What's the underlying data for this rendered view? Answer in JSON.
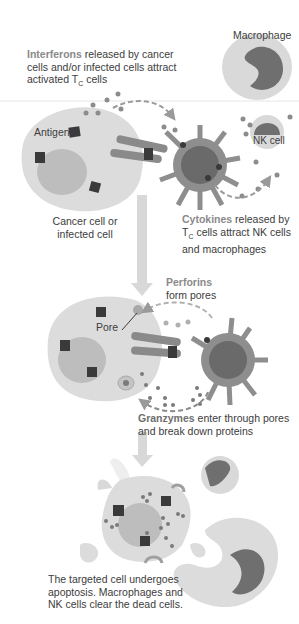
{
  "diagram": {
    "colors": {
      "cell_fill": "#dcdcdc",
      "nucleus_fill": "#bdbdbd",
      "antigen": "#3a3a3a",
      "tcell_body": "#8e8e8e",
      "tcell_core": "#6a6a6a",
      "receptor": "#8a8a8a",
      "dots": "#8c8c8c",
      "arrow": "#c8c8c8",
      "macrophage_outer": "#d8d8d8",
      "macrophage_nucleus": "#6f6f6f"
    },
    "stage1": {
      "interferons_keyword": "Interferons",
      "interferons_rest": " released by cancer cells and/or infected cells attract activated T",
      "interferons_sub": "C",
      "interferons_tail": " cells",
      "macrophage_label": "Macrophage",
      "antigen_label": "Antigen",
      "nk_label": "NK cell",
      "target_label_line1": "Cancer cell or",
      "target_label_line2": "infected cell",
      "cytokines_keyword": "Cytokines",
      "cytokines_line1_rest": " released by",
      "cytokines_line2_T": "T",
      "cytokines_line2_sub": "C",
      "cytokines_line2_rest": " cells attract NK cells",
      "cytokines_line3": "and macrophages"
    },
    "stage2": {
      "perforins_keyword": "Perforins",
      "perforins_line2": "form pores",
      "pore_label": "Pore",
      "granzymes_keyword": "Granzymes",
      "granzymes_line1_rest": " enter through pores",
      "granzymes_line2": "and break down proteins"
    },
    "stage3": {
      "caption_line1": "The targeted cell undergoes",
      "caption_line2": "apoptosis. Macrophages and",
      "caption_line3": "NK cells clear the dead cells."
    }
  }
}
